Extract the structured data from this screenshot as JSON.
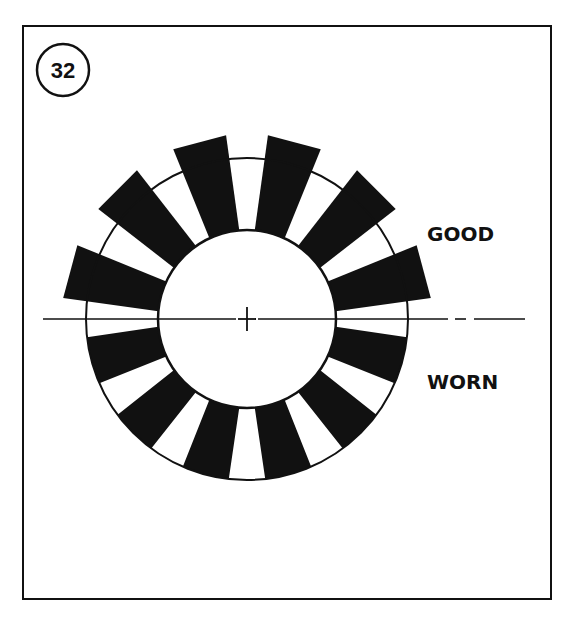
{
  "figure": {
    "badge_number": "32",
    "labels": {
      "good": "GOOD",
      "worn": "WORN"
    },
    "colors": {
      "ink": "#111111",
      "paper": "#ffffff"
    }
  },
  "geometry": {
    "center": [
      247,
      319
    ],
    "inner_radius": 89,
    "outer_radius": 161,
    "good_segment_outer_radius": 185,
    "good_segment_angles_deg": [
      15,
      45,
      75,
      105,
      135,
      165
    ],
    "worn_segment_angles_deg": [
      195,
      225,
      255,
      285,
      315,
      345
    ],
    "segment_inner_half_angle_deg": 10,
    "good_segment_outer_half_angle_deg": 8.5,
    "worn_segment_outer_half_angle_deg": 8.5,
    "badge": {
      "cx": 63,
      "cy": 70,
      "r": 26
    },
    "centerline": {
      "y": 319,
      "segments": [
        [
          43,
          236
        ],
        [
          258,
          448
        ],
        [
          455,
          466
        ],
        [
          474,
          525
        ]
      ]
    },
    "center_cross": {
      "x": 247,
      "y": 319,
      "arm": 9
    },
    "good_label_pos": [
      427,
      241
    ],
    "worn_label_pos": [
      427,
      389
    ]
  }
}
